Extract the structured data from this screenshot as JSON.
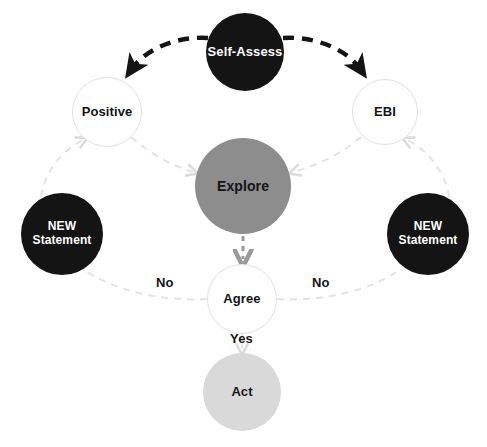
{
  "diagram": {
    "background_color": "#ffffff",
    "colors": {
      "dark_node": "#141414",
      "mid_node": "#8d8d8d",
      "light_node": "#d9d9d9",
      "outline_node_fill": "#ffffff",
      "outline_node_border": "#e2e2e2",
      "primary_arrow": "#141414",
      "faint_arrow": "#e2e2e2",
      "mid_arrow": "#9a9a9a"
    },
    "nodes": [
      {
        "id": "self-assess",
        "label": "Self-Assess",
        "style": "dark",
        "cx": 245,
        "cy": 52,
        "r": 39,
        "font_size": 13
      },
      {
        "id": "positive",
        "label": "Positive",
        "style": "outline",
        "cx": 107,
        "cy": 112,
        "r": 35,
        "font_size": 13
      },
      {
        "id": "ebi",
        "label": "EBI",
        "style": "outline",
        "cx": 385,
        "cy": 112,
        "r": 33,
        "font_size": 13
      },
      {
        "id": "explore",
        "label": "Explore",
        "style": "mid",
        "cx": 243,
        "cy": 186,
        "r": 48,
        "font_size": 14
      },
      {
        "id": "new-statement-left",
        "label": "NEW\nStatement",
        "style": "dark",
        "cx": 62,
        "cy": 234,
        "r": 41,
        "font_size": 12
      },
      {
        "id": "new-statement-right",
        "label": "NEW\nStatement",
        "style": "dark",
        "cx": 428,
        "cy": 234,
        "r": 41,
        "font_size": 12
      },
      {
        "id": "agree",
        "label": "Agree",
        "style": "outline",
        "cx": 242,
        "cy": 299,
        "r": 35,
        "font_size": 13
      },
      {
        "id": "act",
        "label": "Act",
        "style": "light",
        "cx": 242,
        "cy": 392,
        "r": 39,
        "font_size": 13
      }
    ],
    "edge_labels": [
      {
        "id": "no-left",
        "text": "No",
        "x": 156,
        "y": 275
      },
      {
        "id": "no-right",
        "text": "No",
        "x": 312,
        "y": 275
      },
      {
        "id": "yes",
        "text": "Yes",
        "x": 232,
        "y": 333
      }
    ],
    "edges": [
      {
        "id": "self-assess-to-positive",
        "from": "self-assess",
        "to": "positive",
        "style": "bold-dashed",
        "arrow": true
      },
      {
        "id": "self-assess-to-ebi",
        "from": "self-assess",
        "to": "ebi",
        "style": "bold-dashed",
        "arrow": true
      },
      {
        "id": "positive-to-explore",
        "from": "positive",
        "to": "explore",
        "style": "faint-dashed",
        "arrow": true
      },
      {
        "id": "ebi-to-explore",
        "from": "ebi",
        "to": "explore",
        "style": "faint-dashed",
        "arrow": true
      },
      {
        "id": "explore-to-agree",
        "from": "explore",
        "to": "agree",
        "style": "mid-dashed",
        "arrow": true
      },
      {
        "id": "agree-to-new-statement-left",
        "from": "agree",
        "to": "new-statement-left",
        "style": "faint-dashed",
        "arrow": false
      },
      {
        "id": "agree-to-new-statement-right",
        "from": "agree",
        "to": "new-statement-right",
        "style": "faint-dashed",
        "arrow": false
      },
      {
        "id": "new-statement-left-to-positive",
        "from": "new-statement-left",
        "to": "positive",
        "style": "faint-dashed",
        "arrow": true
      },
      {
        "id": "new-statement-right-to-ebi",
        "from": "new-statement-right",
        "to": "ebi",
        "style": "faint-dashed",
        "arrow": true
      },
      {
        "id": "agree-to-act",
        "from": "agree",
        "to": "act",
        "style": "faint-dashed",
        "arrow": true
      }
    ]
  }
}
